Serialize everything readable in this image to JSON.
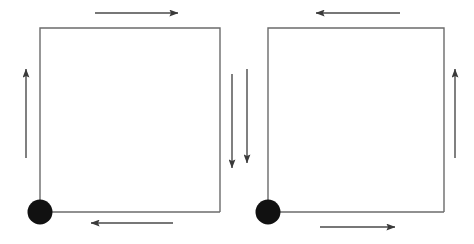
{
  "figure": {
    "width": 474,
    "height": 244,
    "background_color": "#ffffff",
    "line_color": "#6b6b6b",
    "arrow_color": "#4a4a4a",
    "node_color": "#111111",
    "loop_stroke_width": 1.4,
    "arrow_stroke_width": 1.4
  },
  "loops": [
    {
      "id": "left-loop",
      "name": "left-square-loop",
      "circulation": "counterclockwise",
      "square": {
        "x": 40,
        "y": 28,
        "width": 180,
        "height": 184
      },
      "node": {
        "cx": 40,
        "cy": 212,
        "r": 12.5
      },
      "lead": {
        "x1": 40,
        "y1": 212,
        "x2": 220,
        "y2": 212
      }
    },
    {
      "id": "right-loop",
      "name": "right-square-loop",
      "circulation": "clockwise",
      "square": {
        "x": 268,
        "y": 28,
        "width": 176,
        "height": 184
      },
      "node": {
        "cx": 268,
        "cy": 212,
        "r": 12.5
      },
      "lead": {
        "x1": 268,
        "y1": 212,
        "x2": 444,
        "y2": 212
      }
    }
  ],
  "arrows": [
    {
      "id": "left-top-arrow",
      "name": "left-loop-top-direction-arrow",
      "direction": "right",
      "x1": 95,
      "y1": 13,
      "x2": 178,
      "y2": 13
    },
    {
      "id": "left-side-arrow",
      "name": "left-loop-left-direction-arrow",
      "direction": "up",
      "x1": 26,
      "y1": 158,
      "x2": 26,
      "y2": 69
    },
    {
      "id": "left-bottom-arrow",
      "name": "left-loop-bottom-direction-arrow",
      "direction": "left",
      "x1": 173,
      "y1": 223,
      "x2": 91,
      "y2": 223
    },
    {
      "id": "mid-left-arrow",
      "name": "left-loop-right-direction-arrow",
      "direction": "down",
      "x1": 232,
      "y1": 74,
      "x2": 232,
      "y2": 168
    },
    {
      "id": "mid-right-arrow",
      "name": "right-loop-left-direction-arrow",
      "direction": "down",
      "x1": 247,
      "y1": 69,
      "x2": 247,
      "y2": 163
    },
    {
      "id": "right-top-arrow",
      "name": "right-loop-top-direction-arrow",
      "direction": "left",
      "x1": 400,
      "y1": 13,
      "x2": 316,
      "y2": 13
    },
    {
      "id": "right-side-arrow",
      "name": "right-loop-right-direction-arrow",
      "direction": "up",
      "x1": 455,
      "y1": 158,
      "x2": 455,
      "y2": 69
    },
    {
      "id": "right-bottom-arrow",
      "name": "right-loop-bottom-direction-arrow",
      "direction": "right",
      "x1": 320,
      "y1": 227,
      "x2": 395,
      "y2": 227
    }
  ]
}
